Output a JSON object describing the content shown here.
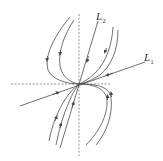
{
  "diagram": {
    "type": "phase-portrait",
    "colors": {
      "stroke": "#4a4a4a",
      "axis": "#777777",
      "background": "#ffffff"
    },
    "labels": {
      "L1": {
        "text": "L",
        "sub": "1"
      },
      "L2": {
        "text": "L",
        "sub": "2"
      }
    }
  }
}
